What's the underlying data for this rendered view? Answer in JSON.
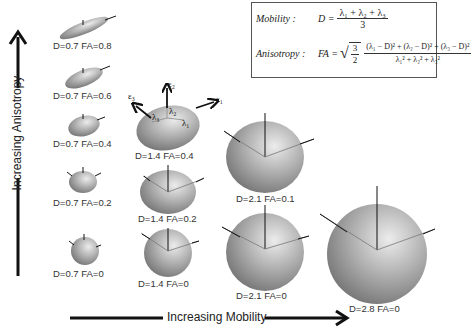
{
  "axes": {
    "y_label": "Increasing Anisotropy",
    "x_label": "Increasing Mobility"
  },
  "formulas": {
    "mobility_label": "Mobility :",
    "mobility_lhs": "D =",
    "mobility_num": "λ₁ + λ₂ + λ₃",
    "mobility_den": "3",
    "anisotropy_label": "Anisotropy :",
    "anisotropy_lhs": "FA =",
    "anisotropy_coef_num": "3",
    "anisotropy_coef_den": "2",
    "anisotropy_num": "(λ₁ − D)² + (λ₂ − D)² + (λ₃ − D)²",
    "anisotropy_den": "λ₁² + λ₂² + λ₃²"
  },
  "annotations": {
    "eps1": "ε₁",
    "eps2": "ε₂",
    "eps3": "ε₃",
    "lam1": "λ₁",
    "lam2": "λ₂",
    "lam3": "λ₃"
  },
  "ellipsoids": [
    {
      "id": "d07-fa08",
      "label": "D=0.7   FA=0.8",
      "D": 0.7,
      "FA": 0.8
    },
    {
      "id": "d07-fa06",
      "label": "D=0.7   FA=0.6",
      "D": 0.7,
      "FA": 0.6
    },
    {
      "id": "d07-fa04",
      "label": "D=0.7   FA=0.4",
      "D": 0.7,
      "FA": 0.4
    },
    {
      "id": "d07-fa02",
      "label": "D=0.7   FA=0.2",
      "D": 0.7,
      "FA": 0.2
    },
    {
      "id": "d07-fa0",
      "label": "D=0.7   FA=0",
      "D": 0.7,
      "FA": 0
    },
    {
      "id": "d14-fa04",
      "label": "D=1.4   FA=0.4",
      "D": 1.4,
      "FA": 0.4
    },
    {
      "id": "d14-fa02",
      "label": "D=1.4   FA=0.2",
      "D": 1.4,
      "FA": 0.2
    },
    {
      "id": "d14-fa0",
      "label": "D=1.4   FA=0",
      "D": 1.4,
      "FA": 0
    },
    {
      "id": "d21-fa01",
      "label": "D=2.1   FA=0.1",
      "D": 2.1,
      "FA": 0.1
    },
    {
      "id": "d21-fa0",
      "label": "D=2.1   FA=0",
      "D": 2.1,
      "FA": 0
    },
    {
      "id": "d28-fa0",
      "label": "D=2.8   FA=0",
      "D": 2.8,
      "FA": 0
    }
  ],
  "colors": {
    "shape_light": "#e2e2e2",
    "shape_mid": "#a8a8a8",
    "shape_dark": "#6a6a6a",
    "axis": "#111111"
  }
}
